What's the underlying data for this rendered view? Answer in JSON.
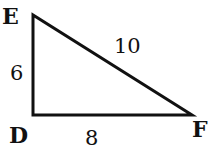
{
  "diagram": {
    "type": "right-triangle",
    "vertices": {
      "E": {
        "label": "E"
      },
      "D": {
        "label": "D"
      },
      "F": {
        "label": "F"
      }
    },
    "sides": {
      "ED": {
        "label": "6"
      },
      "DF": {
        "label": "8"
      },
      "EF": {
        "label": "10"
      }
    },
    "colors": {
      "stroke": "#111111",
      "background": "#ffffff"
    }
  }
}
